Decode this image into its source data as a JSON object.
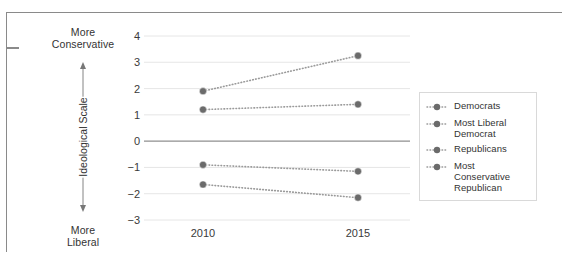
{
  "chart_data": {
    "type": "line",
    "title": "",
    "subtitle": "",
    "xlabel": "",
    "ylabel": "Ideological Scale",
    "ylabel_top_note": "More Conservative",
    "ylabel_bottom_note": "More Liberal",
    "x": [
      "2010",
      "2015"
    ],
    "x_tick_labels": [
      "2010",
      "2015"
    ],
    "y_tick_labels": [
      "4",
      "3",
      "2",
      "1",
      "0",
      "-1",
      "-2",
      "-3"
    ],
    "y_ticks": [
      4,
      3,
      2,
      1,
      0,
      -1,
      -2,
      -3
    ],
    "ylim": [
      -3,
      4
    ],
    "grid": true,
    "grid_axis": "y",
    "legend_position": "right",
    "marker": "circle",
    "linestyle": "dotted",
    "series": [
      {
        "name": "Democrats",
        "values": [
          -0.9,
          -1.15
        ],
        "color": "#6b6b6b"
      },
      {
        "name": "Most Liberal Democrat",
        "values": [
          -1.65,
          -2.15
        ],
        "color": "#6b6b6b"
      },
      {
        "name": "Republicans",
        "values": [
          1.9,
          3.25
        ],
        "color": "#6b6b6b"
      },
      {
        "name": "Most Conservative Republican",
        "values": [
          1.2,
          1.4
        ],
        "color": "#6b6b6b"
      }
    ]
  },
  "axis_annotations": {
    "top_label_line1": "More",
    "top_label_line2": "Conservative",
    "bottom_label_line1": "More",
    "bottom_label_line2": "Liberal",
    "vertical_label": "Ideological Scale"
  },
  "legend": {
    "entries": [
      {
        "label": "Democrats"
      },
      {
        "label": "Most Liberal Democrat"
      },
      {
        "label": "Republicans"
      },
      {
        "label": "Most Conservative Republican"
      }
    ]
  },
  "colors": {
    "marker": "#6b6b6b",
    "line": "#9a9a9a",
    "grid": "#e3e3e3",
    "zero_line": "#8f8f8f",
    "text": "#333333",
    "frame": "#8a8a8a",
    "legend_border": "#d9d9d9"
  }
}
